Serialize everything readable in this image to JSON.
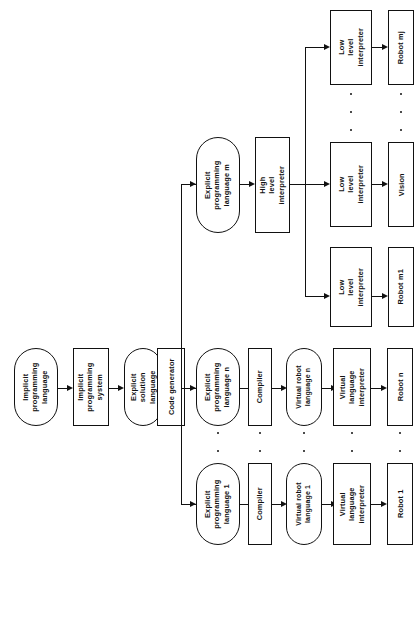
{
  "diagram": {
    "orientation": "rotated-90-ccw",
    "colors": {
      "stroke": "#111111",
      "background": "#ffffff"
    },
    "nodes": {
      "implicit_programming_language": "Implicit\nprogramming\nlanguage",
      "implicit_programming_system": "Implicit\nprogramming\nsystem",
      "explicit_solution_language": "Explicit\nsolution\nlanguage",
      "code_generator": "Code generator",
      "explicit_programming_language_n": "Explicit\nprogramming\nlanguage n",
      "compiler_n": "Compiler",
      "virtual_robot_language_n": "Virtual  robot\nlanguage n",
      "virtual_language_interpreter_n": "Virtual\nlanguage\ninterpreter",
      "robot_n": "Robot n",
      "explicit_programming_language_1": "Explicit\nprogramming\nlanguage 1",
      "compiler_1": "Compiler",
      "virtual_robot_language_1": "Virtual  robot\nlanguage 1",
      "virtual_language_interpreter_1": "Virtual\nlanguage\ninterpreter",
      "robot_1": "Robot 1",
      "explicit_programming_language_m": "Explicit\nprogramming\nlanguage m",
      "high_level_interpreter": "High\nlevel\ninterpreter",
      "low_level_interpreter_mj": "Low\nlevel\ninterpreter",
      "robot_mj": "Robot mj",
      "low_level_interpreter_vision": "Low\nlevel\ninterpreter",
      "vision": "Vision",
      "low_level_interpreter_m1": "Low\nlevel\ninterpreter",
      "robot_m1": "Robot m1"
    }
  }
}
